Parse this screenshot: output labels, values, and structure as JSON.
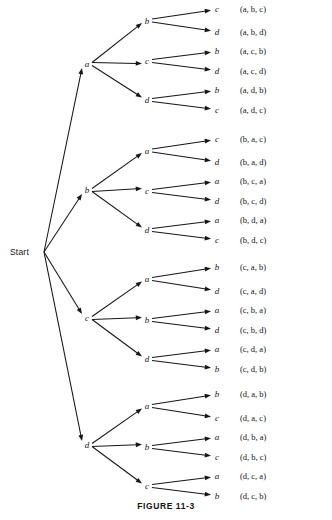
{
  "figure": {
    "caption": "FIGURE 11-3",
    "start_label": "Start",
    "type": "tree-diagram"
  },
  "chart_data": {
    "type": "tree",
    "title": "FIGURE 11-3",
    "root": "Start",
    "alphabet": [
      "a",
      "b",
      "c",
      "d"
    ],
    "levels": 3,
    "branches": [
      {
        "level1": "a",
        "children": [
          {
            "level2": "b",
            "leaves": [
              "c",
              "d"
            ],
            "tuples": [
              "(a, b, c)",
              "(a, b, d)"
            ]
          },
          {
            "level2": "c",
            "leaves": [
              "b",
              "d"
            ],
            "tuples": [
              "(a, c, b)",
              "(a, c, d)"
            ]
          },
          {
            "level2": "d",
            "leaves": [
              "b",
              "c"
            ],
            "tuples": [
              "(a, d, b)",
              "(a, d, c)"
            ]
          }
        ]
      },
      {
        "level1": "b",
        "children": [
          {
            "level2": "a",
            "leaves": [
              "c",
              "d"
            ],
            "tuples": [
              "(b, a, c)",
              "(b, a, d)"
            ]
          },
          {
            "level2": "c",
            "leaves": [
              "a",
              "d"
            ],
            "tuples": [
              "(b, c, a)",
              "(b, c, d)"
            ]
          },
          {
            "level2": "d",
            "leaves": [
              "a",
              "c"
            ],
            "tuples": [
              "(b, d, a)",
              "(b, d, c)"
            ]
          }
        ]
      },
      {
        "level1": "c",
        "children": [
          {
            "level2": "a",
            "leaves": [
              "b",
              "d"
            ],
            "tuples": [
              "(c, a, b)",
              "(c, a, d)"
            ]
          },
          {
            "level2": "b",
            "leaves": [
              "a",
              "d"
            ],
            "tuples": [
              "(c, b, a)",
              "(c, b, d)"
            ]
          },
          {
            "level2": "d",
            "leaves": [
              "a",
              "b"
            ],
            "tuples": [
              "(c, d, a)",
              "(c, d, b)"
            ]
          }
        ]
      },
      {
        "level1": "d",
        "children": [
          {
            "level2": "a",
            "leaves": [
              "b",
              "c"
            ],
            "tuples": [
              "(d, a, b)",
              "(d, a, c)"
            ]
          },
          {
            "level2": "b",
            "leaves": [
              "a",
              "c"
            ],
            "tuples": [
              "(d, b, a)",
              "(d, b, c)"
            ]
          },
          {
            "level2": "c",
            "leaves": [
              "a",
              "b"
            ],
            "tuples": [
              "(d, c, a)",
              "(d, c, b)"
            ]
          }
        ]
      }
    ],
    "colors": {
      "ink": "#161616",
      "background": "#ffffff"
    }
  },
  "geometry": {
    "start_point": {
      "x": 42,
      "y": 252
    },
    "start_text": {
      "x": 10,
      "y": 255
    },
    "level1_x": 87,
    "level2_x": 147,
    "leaf_x": 216,
    "tuple_x": 240,
    "group_level1_y": [
      64,
      190,
      318,
      445
    ],
    "leaf_rows": [
      [
        9,
        32,
        51,
        71,
        90,
        110
      ],
      [
        139,
        162,
        181,
        201,
        220,
        240
      ],
      [
        267,
        291,
        310,
        330,
        349,
        369
      ],
      [
        394,
        418,
        437,
        457,
        476,
        496
      ]
    ],
    "caption": {
      "x": 166,
      "y": 509
    }
  }
}
